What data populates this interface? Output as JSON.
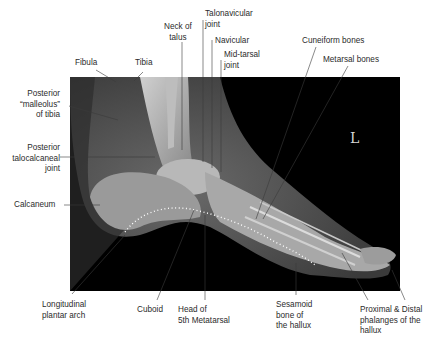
{
  "figure": {
    "side_marker": "L",
    "labels": {
      "fibula": "Fibula",
      "tibia": "Tibia",
      "neck_of_talus": "Neck of\ntalus",
      "talonavicular_joint": "Talonavicular\njoint",
      "navicular": "Navicular",
      "mid_tarsal_joint": "Mid-tarsal\njoint",
      "cuneiform_bones": "Cuneiform bones",
      "metatarsal_bones": "Metarsal bones",
      "posterior_malleolus": "Posterior\n“malleolus”\nof tibia",
      "posterior_talocalcaneal_joint": "Posterior\ntalocalcaneal\njoint",
      "calcaneum": "Calcaneum",
      "longitudinal_plantar_arch": "Longitudinal\nplantar arch",
      "cuboid": "Cuboid",
      "head_of_5th_metatarsal": "Head of\n5th Metatarsal",
      "sesamoid_bone": "Sesamoid\nbone of\nthe hallux",
      "phalanges": "Proximal & Distal\nphalanges of the\nhallux"
    },
    "colors": {
      "background": "#ffffff",
      "xray_background": "#000000",
      "leader_line": "#3a3a3a",
      "arch_dots": "#ffffff"
    }
  }
}
